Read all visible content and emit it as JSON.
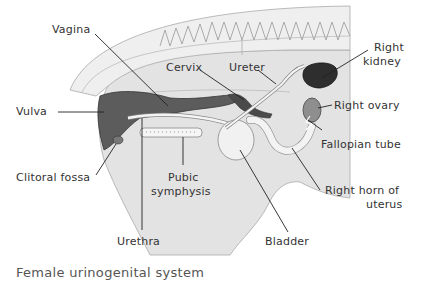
{
  "caption": "Female urinogenital system",
  "labels": {
    "vagina": "Vagina",
    "vulva": "Vulva",
    "cervix": "Cervix",
    "ureter": "Ureter",
    "right_kidney_1": "Right",
    "right_kidney_2": "kidney",
    "right_ovary": "Right ovary",
    "fallopian_tube": "Fallopian tube",
    "clitoral_fossa": "Clitoral fossa",
    "pubic_symphysis_1": "Pubic",
    "pubic_symphysis_2": "symphysis",
    "right_horn_1": "Right horn of",
    "right_horn_2": "uterus",
    "urethra": "Urethra",
    "bladder": "Bladder"
  },
  "colors": {
    "body": "#e4e4e4",
    "spine": "#eeeeee",
    "vagina_vulva": "#5a5a5a",
    "kidney": "#2e2e2e",
    "ovary": "#8a8a8a",
    "organs_light": "#f2f2f2",
    "leader_line": "#222222"
  }
}
